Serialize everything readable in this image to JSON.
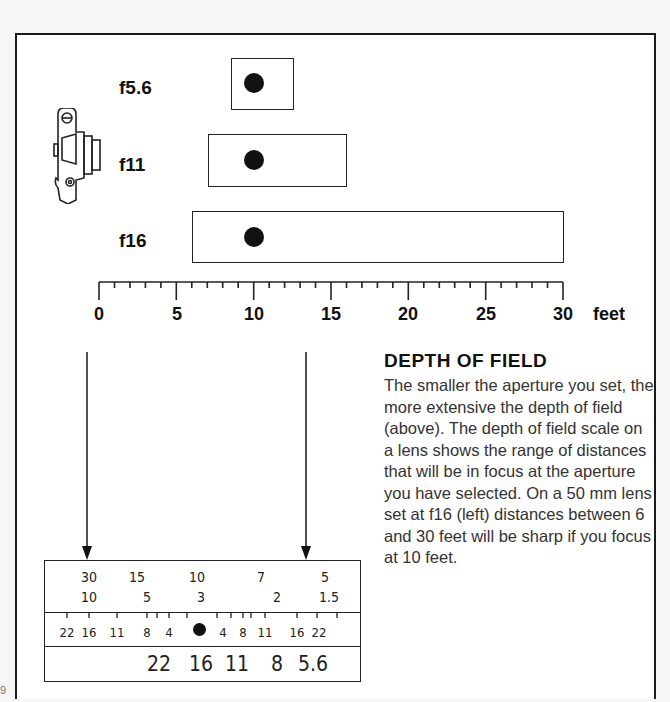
{
  "diagram": {
    "apertures": [
      {
        "label": "f5.6",
        "near_ft": 8.6,
        "far_ft": 12.6,
        "focus_ft": 10
      },
      {
        "label": "f11",
        "near_ft": 7,
        "far_ft": 16,
        "focus_ft": 10
      },
      {
        "label": "f16",
        "near_ft": 6,
        "far_ft": 30,
        "focus_ft": 10
      }
    ],
    "scale": {
      "ticks": [
        "0",
        "5",
        "10",
        "15",
        "20",
        "25",
        "30"
      ],
      "unit": "feet",
      "min": 0,
      "max": 30
    },
    "icon": "camera-side-icon"
  },
  "text": {
    "heading": "DEPTH OF FIELD",
    "body": "The smaller the aperture you set, the more extensive the depth of field (above). The depth of field scale on a lens shows the range of distances that will be in focus at the aperture you have selected. On a 50 mm lens set at f16 (left) distances between 6 and 30 feet will be sharp if you focus at 10 feet."
  },
  "lens_scale": {
    "feet_row": [
      "30",
      "15",
      "10",
      "7",
      "5"
    ],
    "meters_row": [
      "10",
      "5",
      "3",
      "2",
      "1.5"
    ],
    "dof_left": [
      "22",
      "16",
      "11",
      "8",
      "4"
    ],
    "dof_right": [
      "4",
      "8",
      "11",
      "16",
      "22"
    ],
    "aperture_row": [
      "22",
      "16",
      "11",
      "8",
      "5.6"
    ]
  },
  "page_number": "9"
}
